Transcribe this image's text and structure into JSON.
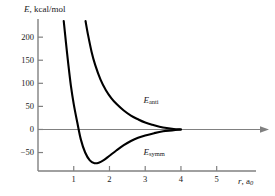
{
  "chart_data": {
    "type": "line",
    "title": "",
    "ylabel": "E, kcal/mol",
    "ylabel_symbol": "E",
    "ylabel_units": ", kcal/mol",
    "xlabel": "r, a0",
    "xlabel_symbol": "r",
    "xlabel_units": ", a",
    "xlabel_subscript": "0",
    "xlim": [
      0,
      6.1
    ],
    "ylim": [
      -90,
      235
    ],
    "yticks": [
      200,
      150,
      100,
      50,
      0,
      -50
    ],
    "ytick_labels": [
      "200",
      "150",
      "100",
      "50",
      "0",
      "−50"
    ],
    "xticks": [
      1,
      2,
      3,
      4,
      5
    ],
    "xtick_labels": [
      "1",
      "2",
      "3",
      "4",
      "5"
    ],
    "grid": false,
    "legend_position": "inline-annotation",
    "zero_line": true,
    "zero_line_arrow": true,
    "curve_color": "#000000",
    "axis_color": "#808080",
    "series": [
      {
        "name": "E_anti",
        "label_symbol": "E",
        "label_subscript": "anti",
        "label_x": 2.95,
        "label_y": 62,
        "x": [
          1.33,
          1.4,
          1.5,
          1.6,
          1.75,
          1.9,
          2.05,
          2.2,
          2.4,
          2.6,
          2.8,
          3.0,
          3.2,
          3.4,
          3.6,
          3.8,
          4.0
        ],
        "y": [
          235,
          205,
          168,
          140,
          108,
          85,
          68,
          55,
          41,
          30,
          22,
          15,
          10,
          6,
          3,
          1,
          0
        ]
      },
      {
        "name": "E_symm",
        "label_symbol": "E",
        "label_subscript": "symm",
        "label_x": 2.95,
        "label_y": -52,
        "x": [
          0.72,
          0.78,
          0.85,
          0.92,
          1.0,
          1.1,
          1.2,
          1.32,
          1.45,
          1.58,
          1.7,
          1.85,
          2.0,
          2.2,
          2.4,
          2.6,
          2.8,
          3.0,
          3.25,
          3.5,
          3.75,
          4.0
        ],
        "y": [
          235,
          190,
          140,
          95,
          55,
          15,
          -22,
          -50,
          -67,
          -73,
          -72,
          -66,
          -57,
          -45,
          -34,
          -25,
          -18,
          -13,
          -8,
          -4,
          -2,
          0
        ]
      }
    ]
  }
}
